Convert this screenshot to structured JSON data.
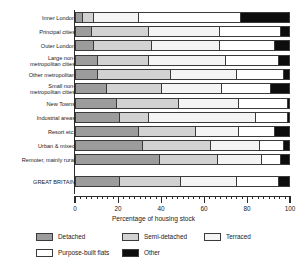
{
  "chart_data": {
    "type": "bar",
    "orientation": "horizontal",
    "stacked": true,
    "stacked_percent": true,
    "title": "",
    "xlabel": "Percentage of housing stock",
    "ylabel": "",
    "xlim": [
      0,
      100
    ],
    "xticks": [
      0,
      20,
      40,
      60,
      80,
      100
    ],
    "xtick_labels": [
      "0",
      "20",
      "40",
      "60",
      "80",
      "100"
    ],
    "minor_tick_step": 2.5,
    "grid": false,
    "legend_position": "bottom",
    "categories": [
      "Inner London",
      "Principal cities",
      "Outer London",
      "Large non-\nmetropolitan cities",
      "Other metropolitan",
      "Small non-\nmetropolitan cities",
      "New Towns",
      "Industrial areas",
      "Resort etc.",
      "Urban & mixed",
      "Remoter, mainly rural",
      "GREAT BRITAIN"
    ],
    "series": [
      {
        "name": "Detached",
        "color": "#9c9c9c",
        "values": [
          3,
          7,
          8,
          10,
          10,
          14,
          19,
          20,
          29,
          31,
          39,
          20
        ]
      },
      {
        "name": "Semi-detached",
        "color": "#d2d2d2",
        "values": [
          5,
          27,
          27,
          24,
          34,
          26,
          29,
          14,
          27,
          32,
          27,
          29
        ]
      },
      {
        "name": "Terraced",
        "color": "#f4f4f4",
        "values": [
          21,
          33,
          32,
          36,
          31,
          28,
          28,
          50,
          20,
          23,
          21,
          26
        ]
      },
      {
        "name": "Purpose-built flats",
        "color": "#ffffff",
        "values": [
          48,
          29,
          26,
          25,
          22,
          23,
          23,
          15,
          17,
          11,
          9,
          20
        ]
      },
      {
        "name": "Other",
        "color": "#0d0d0d",
        "values": [
          23,
          4,
          7,
          5,
          3,
          9,
          1,
          1,
          7,
          3,
          4,
          5
        ]
      }
    ]
  },
  "legend": {
    "rows": [
      [
        "Detached",
        "Semi-detached",
        "Terraced"
      ],
      [
        "Purpose-built flats",
        "Other"
      ]
    ]
  }
}
